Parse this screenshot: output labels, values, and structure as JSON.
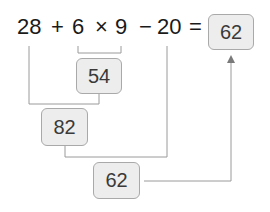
{
  "equation": {
    "tokens": [
      "28",
      "+",
      "6",
      "×",
      "9",
      "−",
      "20",
      "="
    ],
    "result": "62"
  },
  "steps": [
    {
      "label": "54",
      "operation": "6 × 9"
    },
    {
      "label": "82",
      "operation": "28 + 54"
    },
    {
      "label": "62",
      "operation": "82 − 20"
    }
  ],
  "colors": {
    "line": "#9a9a9a",
    "box_fill": "#ededed",
    "box_border": "#a9a9a9",
    "text": "#1a1a1a"
  }
}
